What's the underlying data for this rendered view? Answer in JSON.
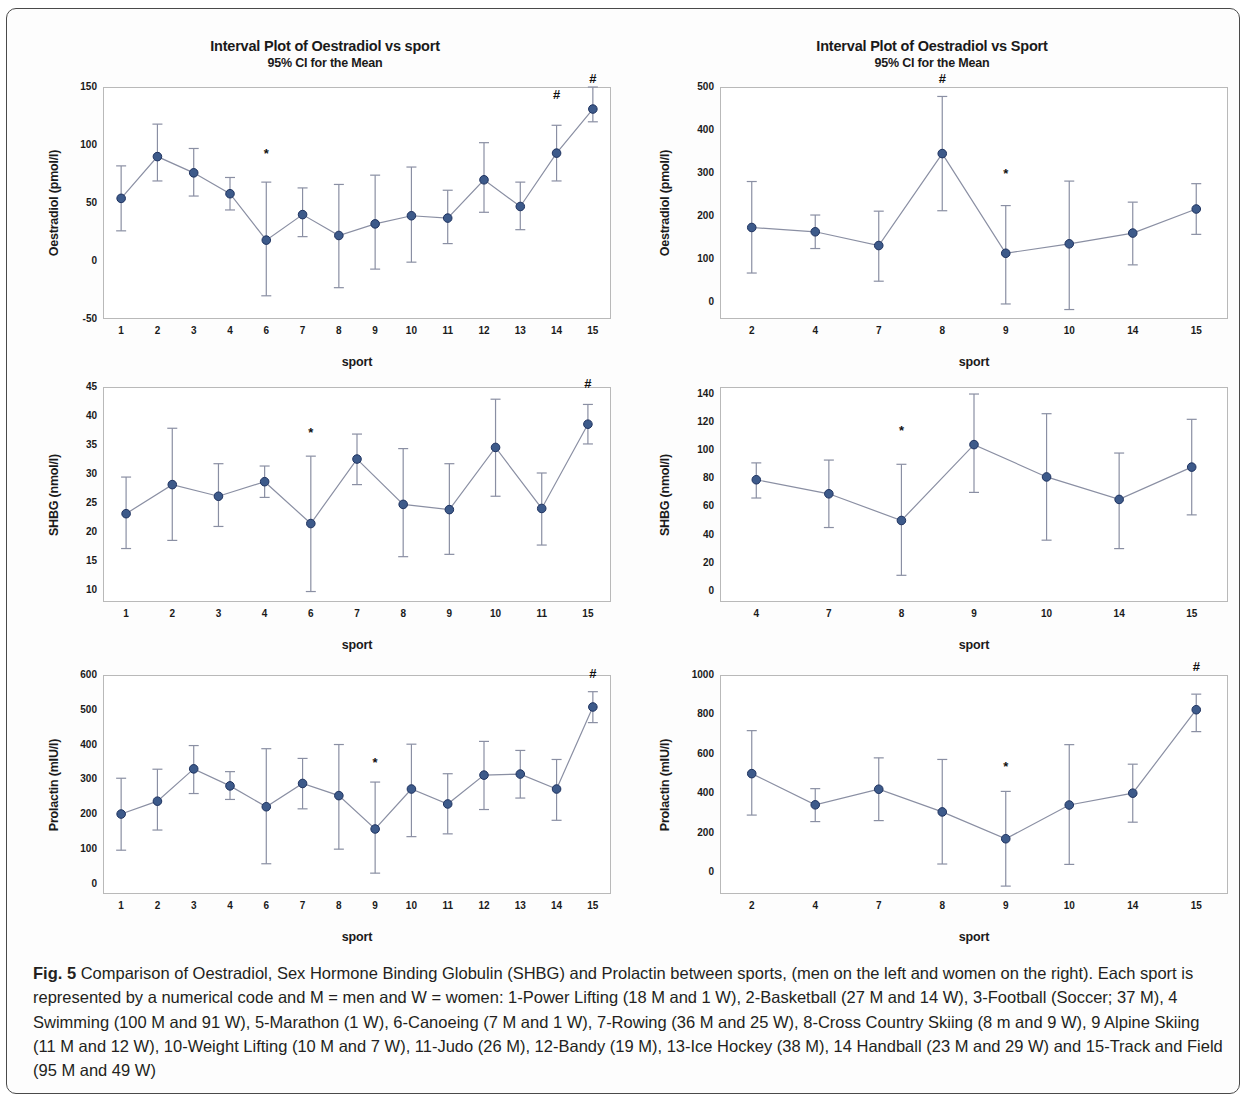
{
  "figure": {
    "label": "Fig. 5",
    "caption_rest": " Comparison of Oestradiol, Sex Hormone Binding Globulin (SHBG) and Prolactin between sports, (men on the left and women on the right). Each sport is represented by a numerical code and M = men and W = women: 1-Power Lifting (18 M and 1 W), 2-Basketball (27 M and 14 W), 3-Football (Soccer; 37 M), 4 Swimming (100 M and 91 W), 5-Marathon (1 W), 6-Canoeing (7 M and 1 W), 7-Rowing (36 M and 25 W), 8-Cross Country Skiing (8 m and 9 W), 9 Alpine Skiing (11 M and 12 W), 10-Weight Lifting (10 M and 7 W), 11-Judo (26 M), 12-Bandy (19 M), 13-Ice Hockey (38 M), 14 Handball (23 M and 29 W) and 15-Track and Field (95 M and 49 W)"
  },
  "colors": {
    "marker": "#3d5a8a",
    "marker_edge": "#1f3360",
    "line": "#8a8fa3",
    "error_bar": "#8a8fa3",
    "axis": "#b9b9b9",
    "text": "#1a1a1a"
  },
  "chart_data": [
    {
      "id": "oestradiol-men",
      "type": "line",
      "title": "Interval Plot of Oestradiol vs sport",
      "subtitle": "95% CI for the Mean",
      "xlabel": "sport",
      "ylabel": "Oestradiol (pmol/l)",
      "ylim": [
        -50,
        150
      ],
      "yticks": [
        -50,
        0,
        50,
        100,
        150
      ],
      "ytick_labels": [
        "-50",
        "0",
        "50",
        "100",
        "150"
      ],
      "categories": [
        "1",
        "2",
        "3",
        "4",
        "6",
        "7",
        "8",
        "9",
        "10",
        "11",
        "12",
        "13",
        "14",
        "15"
      ],
      "values": [
        54,
        90,
        76,
        58,
        18,
        40,
        22,
        32,
        39,
        37,
        70,
        47,
        93,
        131
      ],
      "ci_low": [
        26,
        69,
        56,
        44,
        -30,
        21,
        -23,
        -7,
        -1,
        15,
        42,
        27,
        69,
        120
      ],
      "ci_high": [
        82,
        118,
        97,
        72,
        68,
        63,
        66,
        74,
        81,
        61,
        102,
        68,
        117,
        150
      ],
      "annotations": [
        {
          "category": "6",
          "symbol": "*",
          "y": 85
        },
        {
          "category": "14",
          "symbol": "#",
          "y": 136
        },
        {
          "category": "15",
          "symbol": "#",
          "y": 150
        }
      ]
    },
    {
      "id": "oestradiol-women",
      "type": "line",
      "title": "Interval Plot of Oestradiol vs Sport",
      "subtitle": "95% CI for the Mean",
      "xlabel": "sport",
      "ylabel": "Oestradiol (pmol/l)",
      "ylim": [
        -40,
        500
      ],
      "yticks": [
        0,
        100,
        200,
        300,
        400,
        500
      ],
      "ytick_labels": [
        "0",
        "100",
        "200",
        "300",
        "400",
        "500"
      ],
      "categories": [
        "2",
        "4",
        "7",
        "8",
        "9",
        "10",
        "14",
        "15"
      ],
      "values": [
        173,
        163,
        131,
        345,
        113,
        135,
        160,
        216
      ],
      "ci_low": [
        67,
        124,
        48,
        212,
        -5,
        -18,
        86,
        157
      ],
      "ci_high": [
        280,
        202,
        211,
        478,
        224,
        281,
        232,
        275
      ],
      "annotations": [
        {
          "category": "8",
          "symbol": "#",
          "y": 500
        },
        {
          "category": "9",
          "symbol": "*",
          "y": 280
        }
      ]
    },
    {
      "id": "shbg-men",
      "type": "line",
      "title": "",
      "subtitle": "",
      "xlabel": "sport",
      "ylabel": "SHBG (nmol/l)",
      "ylim": [
        8,
        45
      ],
      "yticks": [
        10,
        15,
        20,
        25,
        30,
        35,
        40,
        45
      ],
      "ytick_labels": [
        "10",
        "15",
        "20",
        "25",
        "30",
        "35",
        "40",
        "45"
      ],
      "categories": [
        "1",
        "2",
        "3",
        "4",
        "6",
        "7",
        "8",
        "9",
        "10",
        "11",
        "15"
      ],
      "values": [
        23.2,
        28.2,
        26.2,
        28.7,
        21.5,
        32.6,
        24.8,
        23.9,
        34.6,
        24.1,
        38.6
      ],
      "ci_low": [
        17.2,
        18.6,
        21.0,
        26.0,
        9.8,
        28.2,
        15.8,
        16.2,
        26.2,
        17.8,
        35.2
      ],
      "ci_high": [
        29.5,
        37.9,
        31.8,
        31.4,
        33.1,
        36.9,
        34.4,
        31.8,
        42.9,
        30.2,
        42.0
      ],
      "annotations": [
        {
          "category": "6",
          "symbol": "*",
          "y": 35.7
        },
        {
          "category": "15",
          "symbol": "#",
          "y": 44.2
        }
      ]
    },
    {
      "id": "shbg-women",
      "type": "line",
      "title": "",
      "subtitle": "",
      "xlabel": "sport",
      "ylabel": "SHBG (nmol/l)",
      "ylim": [
        -8,
        145
      ],
      "yticks": [
        0,
        20,
        40,
        60,
        80,
        100,
        120,
        140
      ],
      "ytick_labels": [
        "0",
        "20",
        "40",
        "60",
        "80",
        "100",
        "120",
        "140"
      ],
      "categories": [
        "4",
        "7",
        "8",
        "9",
        "10",
        "14",
        "15"
      ],
      "values": [
        79,
        69,
        50,
        104,
        81,
        65,
        88
      ],
      "ci_low": [
        66,
        45,
        11,
        70,
        36,
        30,
        54
      ],
      "ci_high": [
        91,
        93,
        90,
        140,
        126,
        98,
        122
      ],
      "annotations": [
        {
          "category": "8",
          "symbol": "*",
          "y": 108
        }
      ]
    },
    {
      "id": "prolactin-men",
      "type": "line",
      "title": "",
      "subtitle": "",
      "xlabel": "sport",
      "ylabel": "Prolactin (mIU/l)",
      "ylim": [
        -30,
        600
      ],
      "yticks": [
        0,
        100,
        200,
        300,
        400,
        500,
        600
      ],
      "ytick_labels": [
        "0",
        "100",
        "200",
        "300",
        "400",
        "500",
        "600"
      ],
      "categories": [
        "1",
        "2",
        "3",
        "4",
        "6",
        "7",
        "8",
        "9",
        "10",
        "11",
        "12",
        "13",
        "14",
        "15"
      ],
      "values": [
        200,
        237,
        330,
        281,
        221,
        288,
        253,
        157,
        272,
        229,
        312,
        315,
        272,
        508
      ],
      "ci_low": [
        96,
        154,
        259,
        242,
        57,
        215,
        99,
        30,
        135,
        143,
        213,
        246,
        182,
        463
      ],
      "ci_high": [
        303,
        329,
        397,
        322,
        388,
        360,
        400,
        292,
        401,
        316,
        409,
        383,
        357,
        552
      ],
      "annotations": [
        {
          "category": "9",
          "symbol": "*",
          "y": 325
        },
        {
          "category": "15",
          "symbol": "#",
          "y": 580
        }
      ]
    },
    {
      "id": "prolactin-women",
      "type": "line",
      "title": "",
      "subtitle": "",
      "xlabel": "sport",
      "ylabel": "Prolactin (mIU/l)",
      "ylim": [
        -110,
        1000
      ],
      "yticks": [
        0,
        200,
        400,
        600,
        800,
        1000
      ],
      "ytick_labels": [
        "0",
        "200",
        "400",
        "600",
        "800",
        "1000"
      ],
      "categories": [
        "2",
        "4",
        "7",
        "8",
        "9",
        "10",
        "14",
        "15"
      ],
      "values": [
        500,
        342,
        421,
        306,
        170,
        341,
        401,
        824
      ],
      "ci_low": [
        290,
        257,
        262,
        42,
        -70,
        40,
        254,
        713
      ],
      "ci_high": [
        718,
        424,
        580,
        572,
        410,
        647,
        548,
        903
      ],
      "annotations": [
        {
          "category": "9",
          "symbol": "*",
          "y": 492
        },
        {
          "category": "15",
          "symbol": "#",
          "y": 1000
        }
      ]
    }
  ]
}
